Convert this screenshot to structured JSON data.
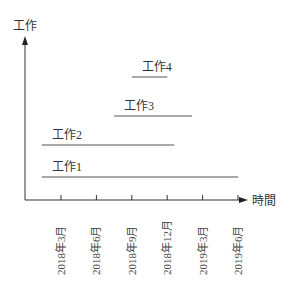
{
  "chart_data": {
    "type": "gantt",
    "title": "",
    "xlabel": "時間",
    "ylabel": "工作",
    "x_ticks": [
      "2018年3月",
      "2018年6月",
      "2018年9月",
      "2018年12月",
      "2019年3月",
      "2019年6月"
    ],
    "tasks": [
      {
        "name": "工作1",
        "start": 0,
        "end": 5
      },
      {
        "name": "工作2",
        "start": 0,
        "end": 3.2
      },
      {
        "name": "工作3",
        "start": 1.5,
        "end": 3.7
      },
      {
        "name": "工作4",
        "start": 2.0,
        "end": 3.0
      }
    ],
    "start_unit_note": "start/end expressed in tick-index units (0 = 2018年3月, 5 = 2019年6月)",
    "grid": false
  },
  "colors": {
    "axis": "#333333",
    "bar": "#555555"
  }
}
